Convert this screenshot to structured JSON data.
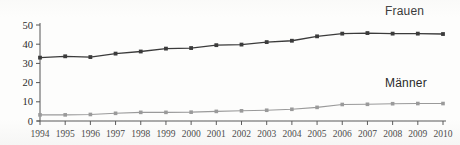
{
  "chart_data": {
    "type": "line",
    "title": "",
    "subtitle": "",
    "xlabel": "",
    "ylabel": "",
    "categories": [
      "1994",
      "1995",
      "1996",
      "1997",
      "1998",
      "1999",
      "2000",
      "2001",
      "2002",
      "2003",
      "2004",
      "2005",
      "2006",
      "2007",
      "2008",
      "2009",
      "2010"
    ],
    "x": [
      1994,
      1995,
      1996,
      1997,
      1998,
      1999,
      2000,
      2001,
      2002,
      2003,
      2004,
      2005,
      2006,
      2007,
      2008,
      2009,
      2010
    ],
    "series": [
      {
        "name": "Frauen",
        "color": "#3b3b3b",
        "marker": "square",
        "values": [
          33.0,
          33.7,
          33.3,
          35.1,
          36.2,
          37.7,
          38.0,
          39.5,
          39.8,
          41.1,
          41.8,
          44.1,
          45.5,
          45.8,
          45.5,
          45.5,
          45.3
        ]
      },
      {
        "name": "Männer",
        "color": "#9a9a9a",
        "marker": "square",
        "values": [
          3.2,
          3.2,
          3.4,
          4.0,
          4.5,
          4.5,
          4.6,
          5.0,
          5.3,
          5.6,
          6.1,
          7.1,
          8.6,
          8.7,
          9.0,
          9.1,
          9.1
        ]
      }
    ],
    "ylim": [
      0,
      50
    ],
    "yticks": [
      0,
      10,
      20,
      30,
      40,
      50
    ],
    "ytick_labels": [
      "0",
      "10",
      "20",
      "30",
      "40",
      "50"
    ],
    "xlim": [
      1994,
      2010
    ],
    "grid": false,
    "legend_position": "inline-right",
    "legend_entries": [
      "Frauen",
      "Männer"
    ]
  },
  "legend": {
    "frauen": "Frauen",
    "maenner": "Männer"
  },
  "axes": {
    "y_label": "",
    "x_label": ""
  }
}
